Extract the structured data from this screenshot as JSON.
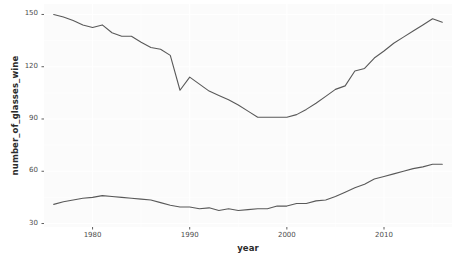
{
  "chart_data": {
    "type": "line",
    "title": "",
    "xlabel": "year",
    "ylabel": "number_of_glasses_wine",
    "xlim": [
      1975,
      2017
    ],
    "ylim": [
      28,
      156
    ],
    "xticks": [
      1980,
      1990,
      2000,
      2010
    ],
    "xtick_labels": [
      "1980",
      "1990",
      "2000",
      "2010"
    ],
    "yticks": [
      30,
      60,
      90,
      120,
      150
    ],
    "ytick_labels": [
      "30",
      "60",
      "90",
      "120",
      "150"
    ],
    "grid": true,
    "legend": "none",
    "line_color": "#595959",
    "panel_color": "#fbfbfb",
    "grid_color": "#ffffff",
    "series": [
      {
        "name": "upper",
        "x": [
          1976,
          1977,
          1978,
          1979,
          1980,
          1981,
          1982,
          1983,
          1984,
          1985,
          1986,
          1987,
          1988,
          1989,
          1990,
          1991,
          1992,
          1993,
          1994,
          1995,
          1996,
          1997,
          1998,
          1999,
          2000,
          2001,
          2002,
          2003,
          2004,
          2005,
          2006,
          2007,
          2008,
          2009,
          2010,
          2011,
          2012,
          2013,
          2014,
          2015,
          2016
        ],
        "values": [
          150.0,
          148.5,
          146.5,
          144.0,
          142.5,
          144.0,
          139.5,
          137.5,
          137.5,
          134.0,
          131.0,
          130.0,
          126.5,
          106.5,
          114.0,
          110.0,
          106.0,
          103.5,
          101.0,
          98.0,
          94.5,
          91.0,
          91.0,
          91.0,
          91.0,
          92.5,
          95.5,
          99.0,
          103.0,
          107.0,
          109.0,
          117.5,
          119.0,
          125.0,
          129.0,
          133.5,
          137.0,
          140.5,
          144.0,
          147.5,
          145.5
        ]
      },
      {
        "name": "lower",
        "x": [
          1976,
          1977,
          1978,
          1979,
          1980,
          1981,
          1982,
          1983,
          1984,
          1985,
          1986,
          1987,
          1988,
          1989,
          1990,
          1991,
          1992,
          1993,
          1994,
          1995,
          1996,
          1997,
          1998,
          1999,
          2000,
          2001,
          2002,
          2003,
          2004,
          2005,
          2006,
          2007,
          2008,
          2009,
          2010,
          2011,
          2012,
          2013,
          2014,
          2015,
          2016
        ],
        "values": [
          41.0,
          42.5,
          43.5,
          44.5,
          45.0,
          46.0,
          45.5,
          45.0,
          44.5,
          44.0,
          43.5,
          42.0,
          40.5,
          39.5,
          39.5,
          38.5,
          39.0,
          37.5,
          38.5,
          37.5,
          38.0,
          38.5,
          38.5,
          40.0,
          40.0,
          41.5,
          41.5,
          43.0,
          43.5,
          45.5,
          48.0,
          50.5,
          52.5,
          55.5,
          57.0,
          58.5,
          60.0,
          61.5,
          62.5,
          64.0,
          64.0
        ]
      }
    ]
  }
}
